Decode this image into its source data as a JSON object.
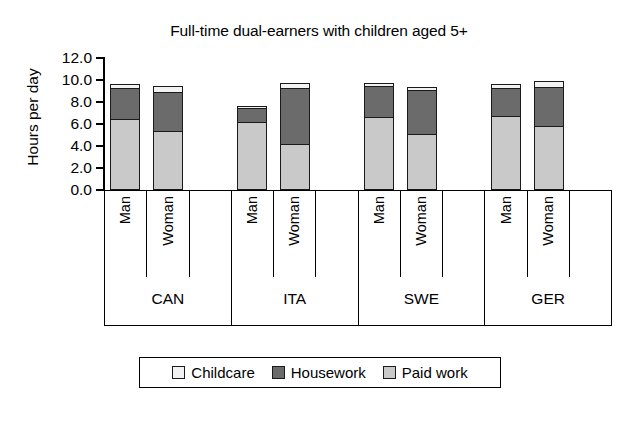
{
  "chart_data": {
    "type": "bar",
    "subtype": "stacked",
    "title": "Full-time dual-earners with children aged 5+",
    "xlabel": "",
    "ylabel": "Hours per day",
    "ylim": [
      0.0,
      12.0
    ],
    "yticks": [
      "0.0",
      "2.0",
      "4.0",
      "6.0",
      "8.0",
      "10.0",
      "12.0"
    ],
    "ytick_values": [
      0.0,
      2.0,
      4.0,
      6.0,
      8.0,
      10.0,
      12.0
    ],
    "grid": false,
    "legend_position": "bottom",
    "groups": [
      "CAN",
      "ITA",
      "SWE",
      "GER"
    ],
    "subgroups": [
      "Man",
      "Woman"
    ],
    "categories": [
      "CAN Man",
      "CAN Woman",
      "ITA Man",
      "ITA Woman",
      "SWE Man",
      "SWE Woman",
      "GER Man",
      "GER Woman"
    ],
    "series": [
      {
        "name": "Paid work",
        "color": "#c9c9c9",
        "values": [
          6.5,
          5.4,
          6.2,
          4.2,
          6.6,
          5.1,
          6.7,
          5.8
        ]
      },
      {
        "name": "Housework",
        "color": "#6b6b6b",
        "values": [
          2.8,
          3.5,
          1.3,
          5.1,
          2.9,
          4.0,
          2.6,
          3.6
        ]
      },
      {
        "name": "Childcare",
        "color": "#f2f2f2",
        "values": [
          0.3,
          0.6,
          0.1,
          0.4,
          0.2,
          0.3,
          0.3,
          0.5
        ]
      }
    ],
    "totals": [
      9.6,
      9.5,
      7.6,
      9.7,
      9.7,
      9.4,
      9.6,
      9.9
    ]
  },
  "legend": {
    "items": [
      {
        "label": "Childcare",
        "color": "#f2f2f2"
      },
      {
        "label": "Housework",
        "color": "#6b6b6b"
      },
      {
        "label": "Paid work",
        "color": "#c9c9c9"
      }
    ]
  },
  "colors": {
    "axis": "#000000",
    "background": "#ffffff",
    "paid_work": "#c9c9c9",
    "housework": "#6b6b6b",
    "childcare": "#f2f2f2"
  }
}
